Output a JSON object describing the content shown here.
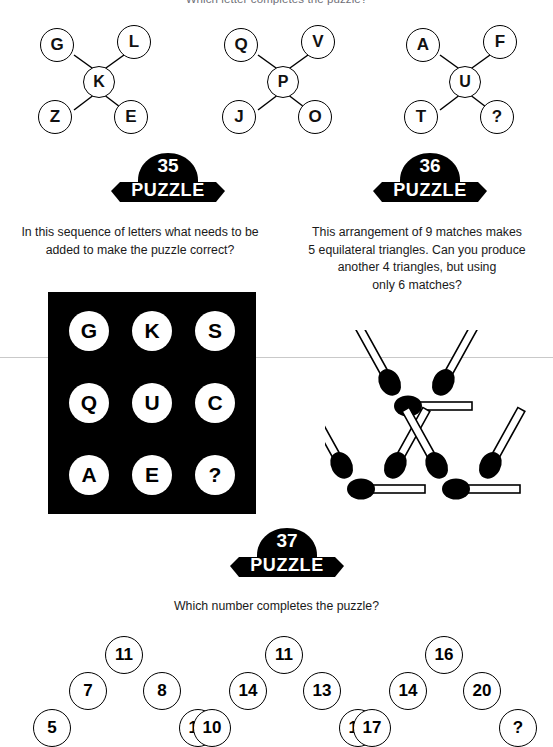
{
  "page": {
    "top_heading": "Which letter completes the puzzle?"
  },
  "letter_puzzles": [
    {
      "name": "letter-star-1",
      "top_left": "G",
      "top_right": "L",
      "center": "K",
      "bottom_left": "Z",
      "bottom_right": "E"
    },
    {
      "name": "letter-star-2",
      "top_left": "Q",
      "top_right": "V",
      "center": "P",
      "bottom_left": "J",
      "bottom_right": "O"
    },
    {
      "name": "letter-star-3",
      "top_left": "A",
      "top_right": "F",
      "center": "U",
      "bottom_left": "T",
      "bottom_right": "?"
    }
  ],
  "puzzle35": {
    "number": "35",
    "word": "PUZZLE",
    "question_line1": "In this sequence of letters what needs to be",
    "question_line2": "added to make the puzzle correct?",
    "grid": [
      [
        "G",
        "K",
        "S"
      ],
      [
        "Q",
        "U",
        "C"
      ],
      [
        "A",
        "E",
        "?"
      ]
    ]
  },
  "puzzle36": {
    "number": "36",
    "word": "PUZZLE",
    "question_line1": "This arrangement of 9 matches makes",
    "question_line2": "5 equilateral triangles. Can you produce",
    "question_line3": "another 4 triangles, but using",
    "question_line4": "only 6 matches?",
    "match_count": "9"
  },
  "puzzle37": {
    "number": "37",
    "word": "PUZZLE",
    "question": "Which number completes the puzzle?",
    "clusters": [
      {
        "name": "number-cluster-1",
        "top": "11",
        "mid_left": "7",
        "mid_right": "8",
        "bottom_left": "5",
        "bottom_right": "10"
      },
      {
        "name": "number-cluster-2",
        "top": "11",
        "mid_left": "14",
        "mid_right": "13",
        "bottom_left": "10",
        "bottom_right": "17"
      },
      {
        "name": "number-cluster-3",
        "top": "16",
        "mid_left": "14",
        "mid_right": "20",
        "bottom_left": "17",
        "bottom_right": "?"
      }
    ]
  },
  "colors": {
    "ink": "#000000",
    "paper": "#ffffff",
    "text": "#1a1a1a",
    "scanline": "#c9c9c9"
  }
}
